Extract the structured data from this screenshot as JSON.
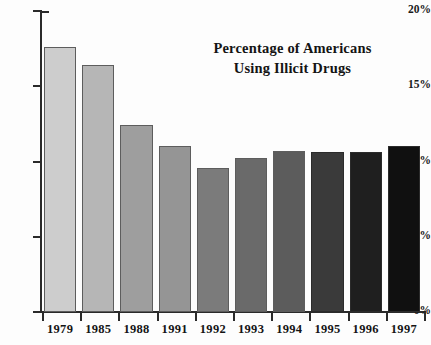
{
  "chart_data": {
    "type": "bar",
    "title": "Percentage of Americans Using Illicit Drugs",
    "title_lines": [
      "Percentage of Americans",
      "Using Illicit Drugs"
    ],
    "xlabel": "",
    "ylabel": "",
    "categories": [
      "1979",
      "1985",
      "1988",
      "1991",
      "1992",
      "1993",
      "1994",
      "1995",
      "1996",
      "1997"
    ],
    "values": [
      17.6,
      16.4,
      12.4,
      11.0,
      9.6,
      10.2,
      10.7,
      10.6,
      10.6,
      11.0
    ],
    "ylim": [
      0,
      20
    ],
    "yticks": [
      0,
      5,
      10,
      15,
      20
    ],
    "ytick_labels": [
      "0%",
      "5%",
      "10%",
      "15%",
      "20%"
    ],
    "grid": false,
    "legend": false,
    "bar_colors": [
      "#cdcdcd",
      "#b6b6b6",
      "#9e9e9e",
      "#959595",
      "#7b7b7b",
      "#6a6a6a",
      "#5c5c5c",
      "#3a3a3a",
      "#1f1f1f",
      "#101010"
    ]
  },
  "axis": {
    "axis_color": "#2a2a2a"
  }
}
